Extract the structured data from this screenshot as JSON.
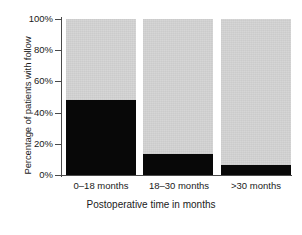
{
  "chart_data": {
    "type": "bar",
    "subtype": "stacked-100-percent",
    "title": "",
    "xlabel": "Postoperative time in months",
    "ylabel": "Percentage of patients with follow",
    "categories": [
      "0–18 months",
      "18–30 months",
      ">30 months"
    ],
    "series": [
      {
        "name": "lost to follow-up",
        "color": "#080808",
        "values": [
          48,
          13.5,
          6.5
        ]
      },
      {
        "name": "with follow-up",
        "color": "#d4d4d4",
        "values": [
          52,
          86.5,
          93.5
        ]
      }
    ],
    "ylim": [
      0,
      100
    ],
    "yticks": [
      "0%",
      "20%",
      "40%",
      "60%",
      "80%",
      "100%"
    ],
    "ytick_values": [
      0,
      20,
      40,
      60,
      80,
      100
    ],
    "grid": false,
    "legend": "none"
  },
  "axes": {
    "y_title": "Percentage of patients with follow",
    "x_title": "Postoperative time in months",
    "y_tick_0": "0%",
    "y_tick_20": "20%",
    "y_tick_40": "40%",
    "y_tick_60": "60%",
    "y_tick_80": "80%",
    "y_tick_100": "100%",
    "x_tick_0": "0–18 months",
    "x_tick_1": "18–30 months",
    "x_tick_2": ">30 months"
  },
  "colors": {
    "dark_segment": "#080808",
    "light_segment": "#d4d4d4",
    "axis": "#4a4a4a",
    "background": "#ffffff"
  }
}
